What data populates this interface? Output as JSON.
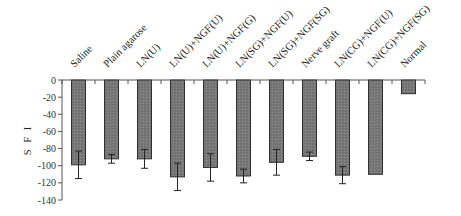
{
  "chart_data": {
    "type": "bar",
    "title": "",
    "xlabel": "",
    "ylabel": "S F I",
    "ylim": [
      -140,
      0
    ],
    "yticks": [
      0,
      -20,
      -40,
      -60,
      -80,
      -100,
      -120,
      -140
    ],
    "grid": false,
    "legend": null,
    "categories": [
      "Saline",
      "Plain agarose",
      "LN(U)",
      "LN(U)+NGF(U)",
      "LN(U)+NGF(G)",
      "LN(SG)+NGF(U)",
      "LN(SG)+NGF(SG)",
      "Nerve graft",
      "LN(CG)+NGF(U)",
      "LN(CG)+NGF(SG)",
      "Normal"
    ],
    "values": [
      -99,
      -92,
      -92,
      -113,
      -102,
      -112,
      -96,
      -89,
      -111,
      -110,
      -16
    ],
    "error": [
      16,
      5,
      11,
      16,
      16,
      8,
      15,
      5,
      10,
      null,
      null
    ],
    "bar_color": "#7a7a7a",
    "category_label_position": "top, rotated 45°"
  }
}
